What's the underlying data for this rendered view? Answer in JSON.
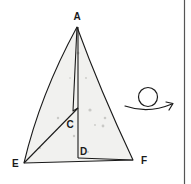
{
  "diagram": {
    "type": "origami-fold-step",
    "colors": {
      "paper_fill": "#f1f1ef",
      "line": "#1a1a1a",
      "background": "#ffffff",
      "border": "#555555",
      "speckle": "#c9c9c6"
    },
    "points": {
      "A": {
        "label": "A",
        "x": 77,
        "y": 27
      },
      "C": {
        "label": "C",
        "x": 78,
        "y": 108
      },
      "D": {
        "label": "D",
        "x": 78,
        "y": 158
      },
      "E": {
        "label": "E",
        "x": 24,
        "y": 163
      },
      "F": {
        "label": "F",
        "x": 133,
        "y": 160
      }
    },
    "labels": [
      {
        "id": "A",
        "text": "A"
      },
      {
        "id": "C",
        "text": "C"
      },
      {
        "id": "D",
        "text": "D"
      },
      {
        "id": "E",
        "text": "E"
      },
      {
        "id": "F",
        "text": "F"
      }
    ],
    "symbol": {
      "name": "turn-over-icon",
      "meaning": "turn model over"
    }
  }
}
